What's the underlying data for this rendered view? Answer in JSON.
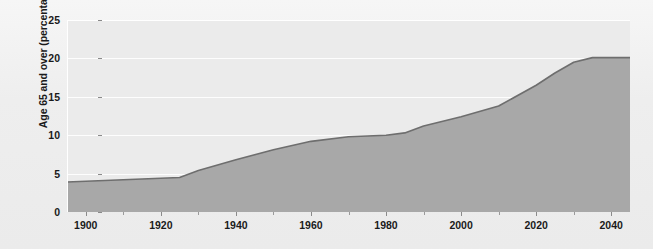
{
  "chart_data": {
    "type": "area",
    "title": "",
    "xlabel": "",
    "ylabel": "Age 65 and over (percentage)",
    "xlim": [
      1895,
      2045
    ],
    "ylim": [
      0,
      25
    ],
    "grid": true,
    "legend": "none",
    "x_ticks": [
      1900,
      1920,
      1940,
      1960,
      1980,
      2000,
      2020,
      2040
    ],
    "x_tick_labels": [
      "1900",
      "1920",
      "1940",
      "1960",
      "1980",
      "2000",
      "2020",
      "2040"
    ],
    "x_minor_ticks": [
      1910,
      1930,
      1950,
      1970,
      1990,
      2010,
      2030
    ],
    "y_ticks": [
      0,
      5,
      10,
      15,
      20,
      25
    ],
    "y_tick_labels": [
      "0",
      "5",
      "10",
      "15",
      "20",
      "25"
    ],
    "series": [
      {
        "name": "Age 65 and over (percentage)",
        "x": [
          1895,
          1900,
          1910,
          1920,
          1925,
          1930,
          1940,
          1950,
          1960,
          1970,
          1980,
          1985,
          1990,
          2000,
          2010,
          2020,
          2025,
          2030,
          2035,
          2040,
          2045
        ],
        "values": [
          3.9,
          4.0,
          4.2,
          4.4,
          4.5,
          5.4,
          6.8,
          8.1,
          9.2,
          9.8,
          10.0,
          10.3,
          11.2,
          12.4,
          13.8,
          16.5,
          18.1,
          19.5,
          20.1,
          20.1,
          20.1
        ],
        "line_color": "#6e6e6e",
        "fill_color": "#a8a8a8"
      }
    ],
    "colors": {
      "plot_background": "#ebebeb",
      "figure_background": "#f0f0f0",
      "gridline": "#fdfdfd",
      "axis_text": "#1a1a1a",
      "tick_mark": "#8a8a8a"
    }
  }
}
